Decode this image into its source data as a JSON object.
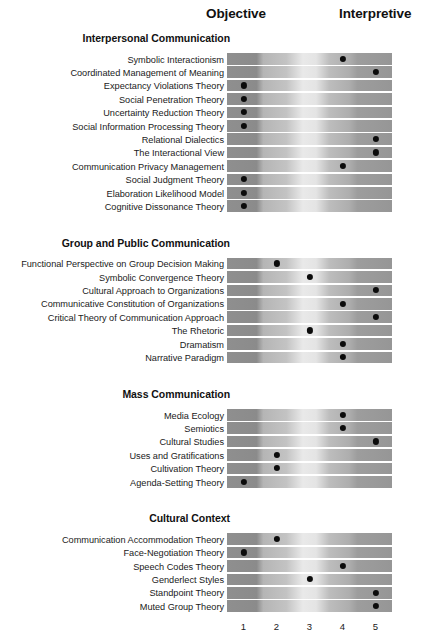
{
  "axis": {
    "left_header": "Objective",
    "right_header": "Interpretive",
    "ticks": [
      "1",
      "2",
      "3",
      "4",
      "5"
    ],
    "scale_min": 1,
    "scale_max": 5
  },
  "colors": {
    "dot": "#0b0b0b",
    "text": "#111111",
    "gradient_dark_left": "#8f8f8f",
    "gradient_light_center": "#e9e9e9",
    "gradient_dark_right": "#969696",
    "background": "#ffffff"
  },
  "chart_data": {
    "type": "scatter",
    "title": "",
    "xlabel": "",
    "ylabel": "",
    "xlim": [
      1,
      5
    ],
    "grid": false,
    "legend": "none",
    "x_axis_left_label": "Objective",
    "x_axis_right_label": "Interpretive",
    "x_tick_labels": [
      "1",
      "2",
      "3",
      "4",
      "5"
    ],
    "sections": [
      {
        "title": "Interpersonal Communication",
        "rows": [
          {
            "label": "Symbolic Interactionism",
            "value": 4
          },
          {
            "label": "Coordinated Management of Meaning",
            "value": 5
          },
          {
            "label": "Expectancy Violations Theory",
            "value": 1
          },
          {
            "label": "Social Penetration Theory",
            "value": 1
          },
          {
            "label": "Uncertainty Reduction Theory",
            "value": 1
          },
          {
            "label": "Social Information Processing Theory",
            "value": 1
          },
          {
            "label": "Relational Dialectics",
            "value": 5
          },
          {
            "label": "The Interactional View",
            "value": 5
          },
          {
            "label": "Communication Privacy Management",
            "value": 4
          },
          {
            "label": "Social Judgment Theory",
            "value": 1
          },
          {
            "label": "Elaboration Likelihood Model",
            "value": 1
          },
          {
            "label": "Cognitive Dissonance Theory",
            "value": 1
          }
        ]
      },
      {
        "title": "Group and Public Communication",
        "rows": [
          {
            "label": "Functional Perspective on Group Decision Making",
            "value": 2
          },
          {
            "label": "Symbolic Convergence Theory",
            "value": 3
          },
          {
            "label": "Cultural Approach to Organizations",
            "value": 5
          },
          {
            "label": "Communicative Constitution of Organizations",
            "value": 4
          },
          {
            "label": "Critical Theory of Communication Approach",
            "value": 5
          },
          {
            "label": "The Rhetoric",
            "value": 3
          },
          {
            "label": "Dramatism",
            "value": 4
          },
          {
            "label": "Narrative Paradigm",
            "value": 4
          }
        ]
      },
      {
        "title": "Mass Communication",
        "rows": [
          {
            "label": "Media Ecology",
            "value": 4
          },
          {
            "label": "Semiotics",
            "value": 4
          },
          {
            "label": "Cultural Studies",
            "value": 5
          },
          {
            "label": "Uses and Gratifications",
            "value": 2
          },
          {
            "label": "Cultivation Theory",
            "value": 2
          },
          {
            "label": "Agenda-Setting Theory",
            "value": 1
          }
        ]
      },
      {
        "title": "Cultural Context",
        "rows": [
          {
            "label": "Communication Accommodation Theory",
            "value": 2
          },
          {
            "label": "Face-Negotiation Theory",
            "value": 1
          },
          {
            "label": "Speech Codes Theory",
            "value": 4
          },
          {
            "label": "Genderlect Styles",
            "value": 3
          },
          {
            "label": "Standpoint Theory",
            "value": 5
          },
          {
            "label": "Muted Group Theory",
            "value": 5
          }
        ]
      }
    ]
  }
}
